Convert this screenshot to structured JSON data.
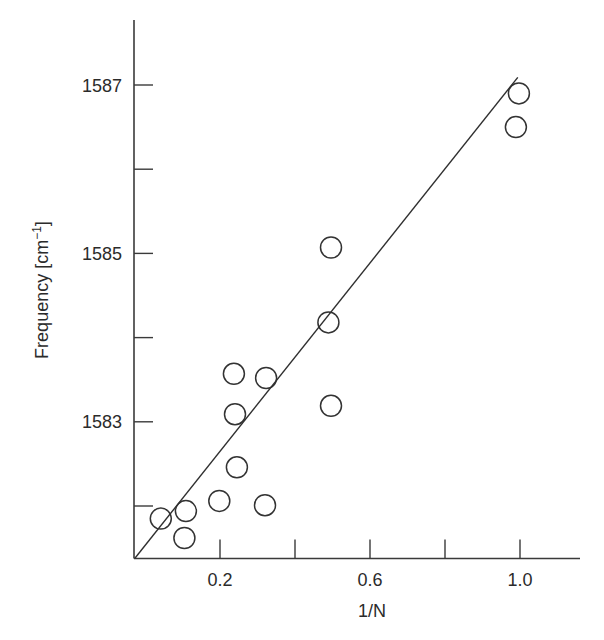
{
  "chart_data": {
    "type": "scatter",
    "title": "",
    "xlabel": "1/N",
    "ylabel": "Frequency [cm⁻¹]",
    "ylabel_parts": {
      "main": "Frequency [cm",
      "sup": "−1",
      "end": "]"
    },
    "xlim": [
      -0.029,
      1.16
    ],
    "ylim": [
      1581.38,
      1587.77
    ],
    "grid": false,
    "legend": null,
    "x_ticks": [
      {
        "value": 0.2,
        "label": "0.2"
      },
      {
        "value": 0.4,
        "label": ""
      },
      {
        "value": 0.6,
        "label": "0.6"
      },
      {
        "value": 0.8,
        "label": ""
      },
      {
        "value": 1.0,
        "label": "1.0"
      }
    ],
    "y_ticks": [
      {
        "value": 1582,
        "label": ""
      },
      {
        "value": 1583,
        "label": "1583"
      },
      {
        "value": 1584,
        "label": ""
      },
      {
        "value": 1585,
        "label": "1585"
      },
      {
        "value": 1586,
        "label": ""
      },
      {
        "value": 1587,
        "label": "1587"
      }
    ],
    "series": [
      {
        "name": "measured",
        "marker": "open-circle",
        "points": [
          {
            "x": 0.042,
            "y": 1581.85
          },
          {
            "x": 0.105,
            "y": 1581.62
          },
          {
            "x": 0.109,
            "y": 1581.94
          },
          {
            "x": 0.198,
            "y": 1582.06
          },
          {
            "x": 0.245,
            "y": 1582.46
          },
          {
            "x": 0.24,
            "y": 1583.09
          },
          {
            "x": 0.237,
            "y": 1583.57
          },
          {
            "x": 0.32,
            "y": 1582.01
          },
          {
            "x": 0.323,
            "y": 1583.52
          },
          {
            "x": 0.496,
            "y": 1583.19
          },
          {
            "x": 0.489,
            "y": 1584.18
          },
          {
            "x": 0.496,
            "y": 1585.07
          },
          {
            "x": 0.989,
            "y": 1586.5
          },
          {
            "x": 0.997,
            "y": 1586.9
          }
        ]
      },
      {
        "name": "linear fit",
        "marker": "line",
        "points": [
          {
            "x": -0.027,
            "y": 1581.38
          },
          {
            "x": 0.994,
            "y": 1587.09
          }
        ]
      }
    ]
  },
  "layout": {
    "plot": {
      "left": 134,
      "right": 580,
      "top": 20,
      "bottom": 558.5
    },
    "x_map": {
      "origin_px": 145,
      "px_per_unit": 375
    },
    "y_map": {
      "ref_value": 1582,
      "ref_px": 506,
      "px_per_unit": 84.2
    },
    "tick_length": 19,
    "marker_radius": 10.5
  }
}
